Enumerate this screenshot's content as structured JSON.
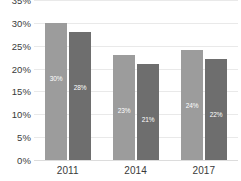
{
  "chart_data": {
    "type": "bar",
    "title": "",
    "xlabel": "",
    "ylabel": "",
    "categories": [
      "2011",
      "2014",
      "2017"
    ],
    "series": [
      {
        "name": "Series 1",
        "color": "#9c9c9c",
        "values": [
          30,
          23,
          24
        ],
        "labels": [
          "30%",
          "23%",
          "24%"
        ]
      },
      {
        "name": "Series 2",
        "color": "#6e6e6e",
        "values": [
          28,
          21,
          22
        ],
        "labels": [
          "28%",
          "21%",
          "22%"
        ]
      }
    ],
    "ylim": [
      0,
      35
    ],
    "y_ticks": [
      35,
      30,
      25,
      20,
      15,
      10,
      5,
      0
    ],
    "y_tick_labels": [
      "35%",
      "30%",
      "25%",
      "20%",
      "15%",
      "10%",
      "5%",
      "0%"
    ],
    "grid": true,
    "legend": "none",
    "value_label_color": "#ffffff",
    "gridline_color": "#e9e9e9",
    "background": "#ffffff"
  }
}
